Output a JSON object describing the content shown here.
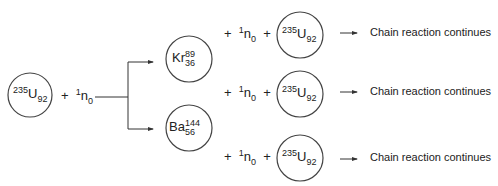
{
  "reactant": {
    "mass": "235",
    "symbol": "U",
    "atomic": "92"
  },
  "neutron": {
    "plus": "+",
    "mass": "1",
    "symbol": "n",
    "atomic": "0"
  },
  "products": [
    {
      "symbol": "Kr",
      "mass": "89",
      "atomic": "36"
    },
    {
      "symbol": "Ba",
      "mass": "144",
      "atomic": "56"
    }
  ],
  "rows": [
    {
      "plus1": "+",
      "n_mass": "1",
      "n_symbol": "n",
      "n_atomic": "0",
      "plus2": "+",
      "u_mass": "235",
      "u_symbol": "U",
      "u_atomic": "92",
      "text": "Chain reaction continues"
    },
    {
      "plus1": "+",
      "n_mass": "1",
      "n_symbol": "n",
      "n_atomic": "0",
      "plus2": "+",
      "u_mass": "235",
      "u_symbol": "U",
      "u_atomic": "92",
      "text": "Chain reaction continues"
    },
    {
      "plus1": "+",
      "n_mass": "1",
      "n_symbol": "n",
      "n_atomic": "0",
      "plus2": "+",
      "u_mass": "235",
      "u_symbol": "U",
      "u_atomic": "92",
      "text": "Chain reaction continues"
    }
  ]
}
